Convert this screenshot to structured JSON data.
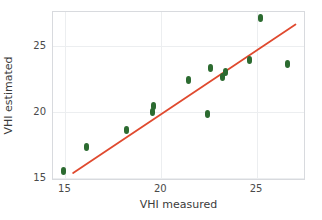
{
  "chart_data": {
    "type": "scatter",
    "title": "",
    "xlabel": "VHI measured",
    "ylabel": "VHI estimated",
    "xlim": [
      14.35,
      27.55
    ],
    "ylim": [
      14.75,
      27.55
    ],
    "xticks": [
      15,
      20,
      25
    ],
    "yticks": [
      15,
      20,
      25
    ],
    "xticklabels": [
      "15",
      "20",
      "25"
    ],
    "yticklabels": [
      "15",
      "20",
      "25"
    ],
    "grid": true,
    "legend": null,
    "marker_color": "#2c6b30",
    "marker_symbol": "diamond",
    "points": [
      {
        "x": 14.9,
        "y": 15.5
      },
      {
        "x": 16.1,
        "y": 17.3
      },
      {
        "x": 18.2,
        "y": 18.6
      },
      {
        "x": 19.55,
        "y": 20.0
      },
      {
        "x": 19.6,
        "y": 20.4
      },
      {
        "x": 21.4,
        "y": 22.4
      },
      {
        "x": 22.4,
        "y": 19.8
      },
      {
        "x": 22.55,
        "y": 23.3
      },
      {
        "x": 23.2,
        "y": 22.6
      },
      {
        "x": 23.35,
        "y": 23.0
      },
      {
        "x": 24.6,
        "y": 23.9
      },
      {
        "x": 25.2,
        "y": 27.1
      },
      {
        "x": 26.6,
        "y": 23.6
      }
    ],
    "fit_line": {
      "color": "#e04a2f",
      "x_start": 15.4,
      "y_start": 15.35,
      "x_end": 27.0,
      "y_end": 26.6
    }
  }
}
